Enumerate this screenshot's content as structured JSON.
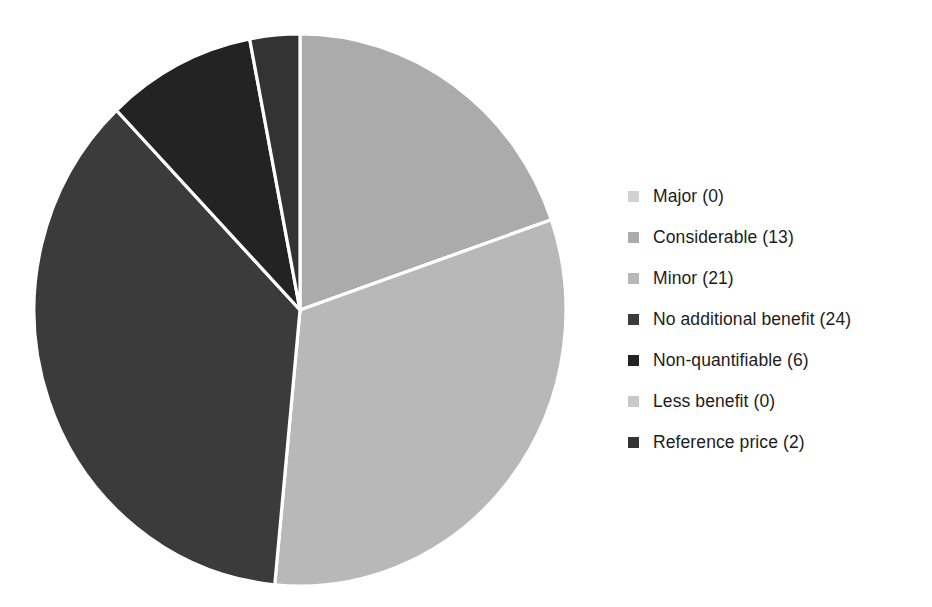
{
  "chart_data": {
    "type": "pie",
    "title": "",
    "subtitle": "",
    "xlabel": "",
    "ylabel": "",
    "grid": false,
    "legend_position": "right",
    "start_angle_deg": 0,
    "direction": "clockwise",
    "total": 66,
    "categories": [
      "Major",
      "Considerable",
      "Minor",
      "No additional benefit",
      "Non-quantifiable",
      "Less benefit",
      "Reference price"
    ],
    "values": [
      0,
      13,
      21,
      24,
      6,
      0,
      2
    ],
    "colors": [
      "#d2d2d2",
      "#ababab",
      "#b8b8b8",
      "#3b3b3b",
      "#232323",
      "#c9c9c9",
      "#333333"
    ],
    "slice_separator_color": "#ffffff",
    "slices": [
      {
        "label": "Major",
        "value": 0,
        "percent": 0.0,
        "color": "#d2d2d2"
      },
      {
        "label": "Considerable",
        "value": 13,
        "percent": 19.7,
        "color": "#ababab"
      },
      {
        "label": "Minor",
        "value": 21,
        "percent": 31.8,
        "color": "#b8b8b8"
      },
      {
        "label": "No additional benefit",
        "value": 24,
        "percent": 36.4,
        "color": "#3b3b3b"
      },
      {
        "label": "Non-quantifiable",
        "value": 6,
        "percent": 9.1,
        "color": "#232323"
      },
      {
        "label": "Less benefit",
        "value": 0,
        "percent": 0.0,
        "color": "#c9c9c9"
      },
      {
        "label": "Reference price",
        "value": 2,
        "percent": 3.0,
        "color": "#333333"
      }
    ]
  },
  "legend": {
    "items": [
      {
        "label": "Major (0)",
        "color": "#d2d2d2"
      },
      {
        "label": "Considerable (13)",
        "color": "#ababab"
      },
      {
        "label": "Minor (21)",
        "color": "#b8b8b8"
      },
      {
        "label": "No additional benefit (24)",
        "color": "#3b3b3b"
      },
      {
        "label": "Non-quantifiable (6)",
        "color": "#232323"
      },
      {
        "label": "Less benefit (0)",
        "color": "#c9c9c9"
      },
      {
        "label": "Reference price (2)",
        "color": "#333333"
      }
    ]
  }
}
